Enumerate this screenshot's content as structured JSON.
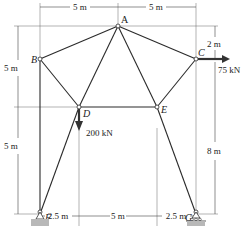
{
  "diagram": {
    "type": "truss",
    "nodes": [
      {
        "id": "A",
        "label": "A",
        "x": 118,
        "y": 26
      },
      {
        "id": "B",
        "label": "B",
        "x": 40,
        "y": 59
      },
      {
        "id": "C",
        "label": "C",
        "x": 196,
        "y": 59
      },
      {
        "id": "D",
        "label": "D",
        "x": 79,
        "y": 107
      },
      {
        "id": "E",
        "label": "E",
        "x": 157,
        "y": 107
      },
      {
        "id": "F",
        "label": "F",
        "x": 40,
        "y": 214
      },
      {
        "id": "G",
        "label": "G",
        "x": 196,
        "y": 214
      }
    ],
    "members": [
      [
        "A",
        "B"
      ],
      [
        "A",
        "C"
      ],
      [
        "A",
        "D"
      ],
      [
        "A",
        "E"
      ],
      [
        "B",
        "D"
      ],
      [
        "B",
        "F"
      ],
      [
        "C",
        "E"
      ],
      [
        "C",
        "G"
      ],
      [
        "D",
        "E"
      ],
      [
        "D",
        "F"
      ],
      [
        "E",
        "G"
      ]
    ],
    "loads": [
      {
        "node": "C",
        "label": "75 kN",
        "direction": "right"
      },
      {
        "node": "D",
        "label": "200 kN",
        "direction": "down"
      }
    ],
    "supports": [
      {
        "node": "F",
        "type": "pin"
      },
      {
        "node": "G",
        "type": "roller"
      }
    ],
    "dimensions": {
      "top": [
        "5 m",
        "5 m"
      ],
      "bottom": [
        "2.5 m",
        "5 m",
        "2.5 m"
      ],
      "left": [
        "5 m",
        "5 m"
      ],
      "right": [
        "2 m",
        "8 m"
      ]
    }
  }
}
